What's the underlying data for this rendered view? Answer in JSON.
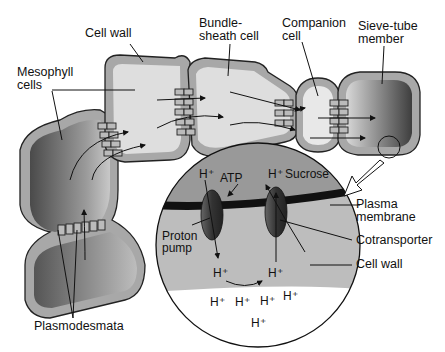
{
  "diagram": {
    "type": "phloem-loading-pathway",
    "labels": {
      "cell_wall_top": "Cell wall",
      "bundle_sheath_line1": "Bundle-",
      "bundle_sheath_line2": "sheath cell",
      "companion_line1": "Companion",
      "companion_line2": "cell",
      "sieve_line1": "Sieve-tube",
      "sieve_line2": "member",
      "mesophyll_line1": "Mesophyll",
      "mesophyll_line2": "cells",
      "plasmodesmata": "Plasmodesmata",
      "plasma_line1": "Plasma",
      "plasma_line2": "membrane",
      "cotransporter": "Cotransporter",
      "cell_wall_right": "Cell wall",
      "proton_line1": "Proton",
      "proton_line2": "pump",
      "atp": "ATP",
      "sucrose": "Sucrose"
    },
    "ions": {
      "h_plus": "H⁺"
    },
    "colors": {
      "wall": "#a8a8a8",
      "outline": "#222222",
      "light_cell": "#dedede",
      "dark_cell": "#555555",
      "cytoplasm_inset": "#9a9a9a",
      "wall_inset": "#bdbdbd"
    }
  }
}
